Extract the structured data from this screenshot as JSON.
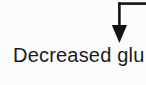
{
  "canvas": {
    "background_color": "#fcfcfc",
    "width_px": 146,
    "height_px": 85
  },
  "diagram": {
    "label": "Decreased glu",
    "label_color": "#1b1b1b",
    "arrow": {
      "shape": "elbow-from-right-then-down",
      "color": "#141414"
    }
  }
}
